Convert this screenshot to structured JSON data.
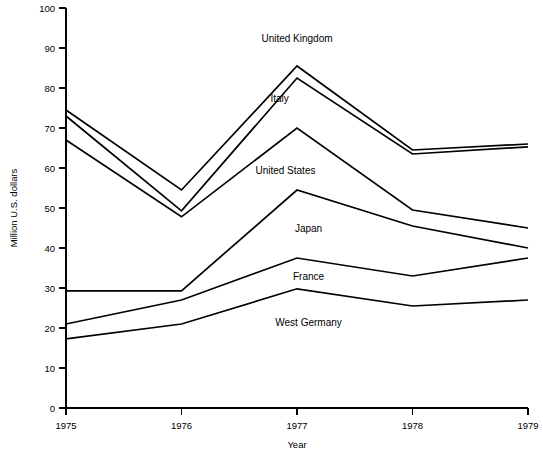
{
  "chart_data": {
    "type": "line",
    "title": "",
    "xlabel": "Year",
    "ylabel": "Million U.S. dollars",
    "categories": [
      "1975",
      "1976",
      "1977",
      "1978",
      "1979"
    ],
    "x": [
      1975,
      1976,
      1977,
      1978,
      1979
    ],
    "xlim": [
      1975,
      1979
    ],
    "ylim": [
      0,
      100
    ],
    "ytick_labels": [
      "0",
      "10",
      "20",
      "30",
      "40",
      "50",
      "60",
      "70",
      "80",
      "90",
      "100"
    ],
    "yticks": [
      0,
      10,
      20,
      30,
      40,
      50,
      60,
      70,
      80,
      90,
      100
    ],
    "xtick_labels": [
      "1975",
      "1976",
      "1977",
      "1978",
      "1979"
    ],
    "grid": false,
    "legend": "inline-labels",
    "line_color": "#000000",
    "background_color": "#ffffff",
    "series": [
      {
        "name": "United Kingdom",
        "values": [
          74.5,
          54.5,
          85.5,
          64.5,
          66.0
        ],
        "label_x": 1977,
        "label_y": 91.5
      },
      {
        "name": "Italy",
        "values": [
          73.0,
          49.3,
          82.5,
          63.5,
          65.3
        ],
        "label_x": 1976.85,
        "label_y": 76.5
      },
      {
        "name": "United States",
        "values": [
          67.0,
          47.8,
          70.0,
          49.5,
          45.0
        ],
        "label_x": 1976.9,
        "label_y": 58.5
      },
      {
        "name": "Japan",
        "values": [
          29.3,
          29.3,
          54.5,
          45.5,
          40.0
        ],
        "label_x": 1977.1,
        "label_y": 44.0
      },
      {
        "name": "France",
        "values": [
          21.0,
          27.0,
          37.5,
          33.0,
          37.5
        ],
        "label_x": 1977.1,
        "label_y": 32.0
      },
      {
        "name": "West Germany",
        "values": [
          17.3,
          21.0,
          29.8,
          25.5,
          27.0
        ],
        "label_x": 1977.1,
        "label_y": 20.5
      }
    ]
  }
}
